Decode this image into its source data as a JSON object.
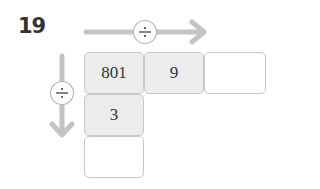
{
  "problem_number": "19",
  "operators": {
    "horizontal": "÷",
    "vertical": "÷"
  },
  "grid": {
    "row1": [
      "801",
      "9",
      ""
    ],
    "column1": [
      "801",
      "3",
      ""
    ]
  },
  "colors": {
    "arrow": "#c4c4c4",
    "filled_cell": "#ececec",
    "border": "#c8c8c8"
  }
}
